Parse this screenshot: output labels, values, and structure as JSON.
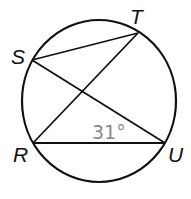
{
  "diagram": {
    "type": "circle-inscribed-angles",
    "circle": {
      "cx": 99,
      "cy": 101,
      "rx": 77,
      "ry": 81,
      "stroke": "#111111"
    },
    "points": {
      "S": {
        "label": "S",
        "x": 32,
        "y": 60
      },
      "T": {
        "label": "T",
        "x": 138,
        "y": 33
      },
      "R": {
        "label": "R",
        "x": 33,
        "y": 143
      },
      "U": {
        "label": "U",
        "x": 165,
        "y": 143
      }
    },
    "segments": [
      {
        "from": "S",
        "to": "T"
      },
      {
        "from": "S",
        "to": "U"
      },
      {
        "from": "R",
        "to": "T"
      },
      {
        "from": "R",
        "to": "U"
      }
    ],
    "angle_label": {
      "text": "31°",
      "at": "U",
      "color": "#8a8a8a"
    }
  }
}
